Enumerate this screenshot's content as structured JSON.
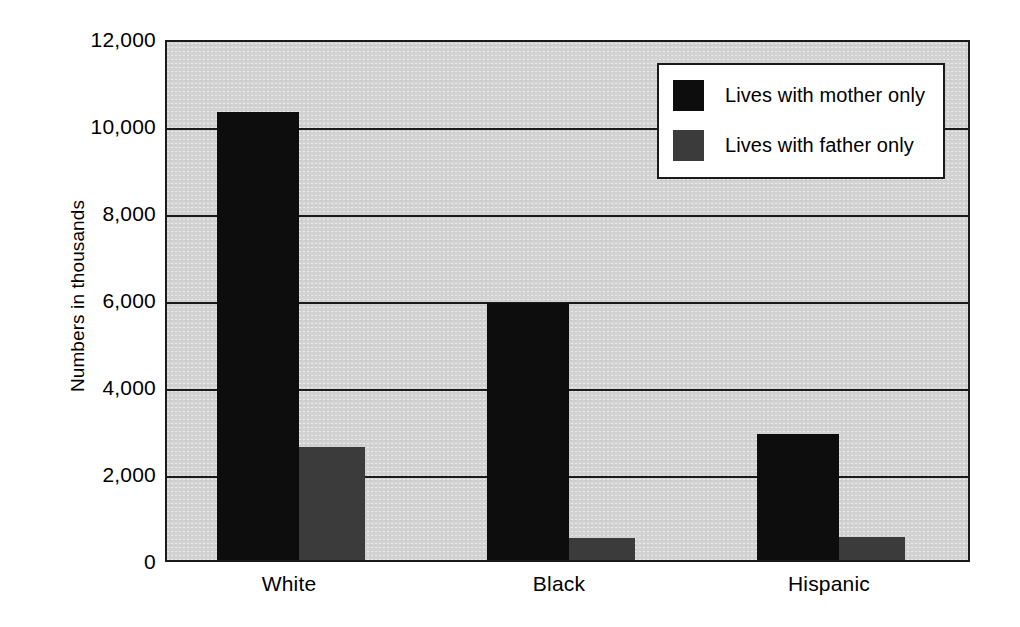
{
  "chart_data": {
    "type": "bar",
    "title": "",
    "xlabel": "",
    "ylabel": "Numbers in thousands",
    "categories": [
      "White",
      "Black",
      "Hispanic"
    ],
    "series": [
      {
        "name": "Lives with mother only",
        "color": "#0d0d0d",
        "values": [
          10300,
          5900,
          2900
        ]
      },
      {
        "name": "Lives with father only",
        "color": "#3b3b3b",
        "values": [
          2600,
          500,
          540
        ]
      }
    ],
    "ylim": [
      0,
      12000
    ],
    "ytick_values": [
      0,
      2000,
      4000,
      6000,
      8000,
      10000,
      12000
    ],
    "ytick_labels": [
      "0",
      "2,000",
      "4,000",
      "6,000",
      "8,000",
      "10,000",
      "12,000"
    ],
    "grid": true,
    "legend_position": "top-right",
    "plot_background": "#d2d2d2",
    "axis_color": "#1a1a1a"
  },
  "legend": {
    "entries": [
      {
        "label": "Lives with mother only"
      },
      {
        "label": "Lives with father only"
      }
    ]
  }
}
